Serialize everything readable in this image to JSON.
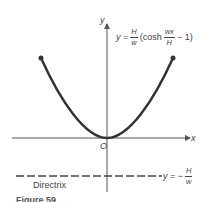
{
  "figure": {
    "axes": {
      "x_label": "x",
      "y_label": "y",
      "origin_label": "O"
    },
    "equation": {
      "lhs": "y =",
      "coef_num": "H",
      "coef_den": "w",
      "func": "(cosh",
      "arg_num": "wx",
      "arg_den": "H",
      "tail": "− 1)"
    },
    "directrix": {
      "label": "Directrix",
      "eq_lhs": "y = −",
      "eq_num": "H",
      "eq_den": "w"
    },
    "caption": "Figure 59",
    "colors": {
      "curve": "#333333",
      "axis": "#555555",
      "directrix": "#444444"
    }
  }
}
